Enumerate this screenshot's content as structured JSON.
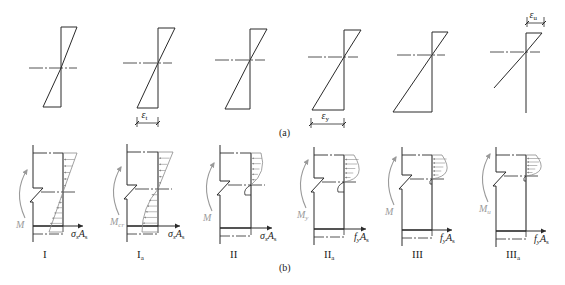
{
  "figure": {
    "panel_a": {
      "caption": "(a)",
      "title": "strain distributions",
      "columns": [
        {
          "axis_x": 61,
          "top": 27,
          "bottom": 107,
          "top_w": 16,
          "bot_w": 18,
          "na_y": 68,
          "na_x1": 29,
          "na_x2": 77
        },
        {
          "axis_x": 158,
          "top": 28,
          "bottom": 108,
          "top_w": 17,
          "bot_w": 21,
          "na_y": 63,
          "na_x1": 123,
          "na_x2": 172
        },
        {
          "axis_x": 250,
          "top": 29,
          "bottom": 109,
          "top_w": 17,
          "bot_w": 25,
          "na_y": 60,
          "na_x1": 215,
          "na_x2": 265
        },
        {
          "axis_x": 344,
          "top": 30,
          "bottom": 110,
          "top_w": 17,
          "bot_w": 32,
          "na_y": 57,
          "na_x1": 308,
          "na_x2": 358
        },
        {
          "axis_x": 432,
          "top": 32,
          "bottom": 112,
          "top_w": 16,
          "bot_w": 39,
          "na_y": 55,
          "na_x1": 397,
          "na_x2": 445
        },
        {
          "axis_x": 526,
          "top": 33,
          "bottom": 113,
          "top_w": 16,
          "bot_w": 0,
          "na_y": 52,
          "na_x1": 490,
          "na_x2": 540
        }
      ],
      "dimensions": [
        {
          "symbol": "ε",
          "subscript": "t",
          "x1": 137,
          "x2": 158,
          "y": 123
        },
        {
          "symbol": "ε",
          "subscript": "y",
          "x1": 311,
          "x2": 344,
          "y": 124
        },
        {
          "symbol": "ε",
          "subscript": "u",
          "x1": 527,
          "x2": 544,
          "y": 23
        }
      ]
    },
    "panel_b": {
      "caption": "(b)",
      "title": "stress distributions",
      "stages": [
        {
          "label": "I",
          "sub": "",
          "moment": "M",
          "moment_sub": "",
          "force": "σ",
          "force_sub": "s",
          "force_A": "A",
          "force_A_sub": "s"
        },
        {
          "label": "I",
          "sub": "a",
          "moment": "M",
          "moment_sub": "cr",
          "force": "σ",
          "force_sub": "s",
          "force_A": "A",
          "force_A_sub": "s"
        },
        {
          "label": "II",
          "sub": "",
          "moment": "M",
          "moment_sub": "",
          "force": "σ",
          "force_sub": "s",
          "force_A": "A",
          "force_A_sub": "s"
        },
        {
          "label": "II",
          "sub": "a",
          "moment": "M",
          "moment_sub": "y",
          "force": "f",
          "force_sub": "y",
          "force_A": "A",
          "force_A_sub": "s"
        },
        {
          "label": "III",
          "sub": "",
          "moment": "M",
          "moment_sub": "",
          "force": "f",
          "force_sub": "y",
          "force_A": "A",
          "force_A_sub": "s"
        },
        {
          "label": "III",
          "sub": "a",
          "moment": "M",
          "moment_sub": "u",
          "force": "f",
          "force_sub": "y",
          "force_A": "A",
          "force_A_sub": "s"
        }
      ]
    },
    "colors": {
      "line": "#2a2a2a",
      "hatch": "#8a8a8a",
      "moment": "#9a9a9a"
    }
  }
}
